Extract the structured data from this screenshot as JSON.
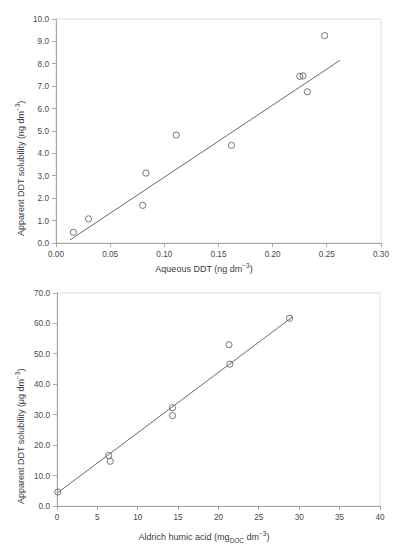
{
  "header": {
    "running_text": ""
  },
  "figure": {
    "panels": [
      {
        "id": "top",
        "y_axis_title_main": "Apparent DDT solubility (ng dm",
        "y_axis_title_sup": "−3",
        "y_axis_title_tail": ")",
        "x_axis_title_main": "Aqueous DDT (ng dm",
        "x_axis_title_sup": "−3",
        "x_axis_title_tail": ")"
      },
      {
        "id": "bottom",
        "y_axis_title_main": "Apparent DDT solubility (μg dm",
        "y_axis_title_sup": "−3",
        "y_axis_title_tail": ")",
        "x_axis_title_pre": "Aldrich humic acid (mg",
        "x_axis_title_sub": "DOC",
        "x_axis_title_mid": " dm",
        "x_axis_title_sup": "−3",
        "x_axis_title_tail": ")"
      }
    ]
  },
  "chart_data": [
    {
      "type": "scatter",
      "id": "apparent-ddt-vs-aqueous-ddt",
      "title": "",
      "xlabel": "Aqueous DDT (ng dm−3)",
      "ylabel": "Apparent DDT solubility (ng dm−3)",
      "xlim": [
        0.0,
        0.3
      ],
      "ylim": [
        0.0,
        10.0
      ],
      "xticks": [
        0.0,
        0.05,
        0.1,
        0.15,
        0.2,
        0.25,
        0.3
      ],
      "xtick_labels": [
        "0.00",
        "0.05",
        "0.10",
        "0.15",
        "0.20",
        "0.25",
        "0.30"
      ],
      "yticks": [
        0.0,
        1.0,
        2.0,
        3.0,
        4.0,
        5.0,
        6.0,
        7.0,
        8.0,
        9.0,
        10.0
      ],
      "ytick_labels": [
        "0.0",
        "1.0",
        "2.0",
        "3.0",
        "4.0",
        "5.0",
        "6.0",
        "7.0",
        "8.0",
        "9.0",
        "10.0"
      ],
      "grid": false,
      "legend": null,
      "marker": "open-circle",
      "points": [
        {
          "x": 0.016,
          "y": 0.48
        },
        {
          "x": 0.03,
          "y": 1.08
        },
        {
          "x": 0.08,
          "y": 1.68
        },
        {
          "x": 0.083,
          "y": 3.12
        },
        {
          "x": 0.111,
          "y": 4.82
        },
        {
          "x": 0.162,
          "y": 4.36
        },
        {
          "x": 0.225,
          "y": 7.44
        },
        {
          "x": 0.228,
          "y": 7.46
        },
        {
          "x": 0.232,
          "y": 6.75
        },
        {
          "x": 0.248,
          "y": 9.26
        }
      ],
      "trendline": {
        "x0": 0.013,
        "y0": 0.14,
        "x1": 0.262,
        "y1": 8.15
      }
    },
    {
      "type": "scatter",
      "id": "apparent-ddt-vs-aldrich-humic-acid",
      "title": "",
      "xlabel": "Aldrich humic acid (mgDOC dm−3)",
      "ylabel": "Apparent DDT solubility (μg dm−3)",
      "xlim": [
        0,
        40
      ],
      "ylim": [
        0.0,
        70.0
      ],
      "xticks": [
        0,
        5,
        10,
        15,
        20,
        25,
        30,
        35,
        40
      ],
      "xtick_labels": [
        "0",
        "5",
        "10",
        "15",
        "20",
        "25",
        "30",
        "35",
        "40"
      ],
      "yticks": [
        0.0,
        10.0,
        20.0,
        30.0,
        40.0,
        50.0,
        60.0,
        70.0
      ],
      "ytick_labels": [
        "0.0",
        "10.0",
        "20.0",
        "30.0",
        "40.0",
        "50.0",
        "60.0",
        "70.0"
      ],
      "grid": false,
      "legend": null,
      "marker": "open-circle",
      "points": [
        {
          "x": 0.1,
          "y": 4.6
        },
        {
          "x": 6.4,
          "y": 16.6
        },
        {
          "x": 6.6,
          "y": 14.7
        },
        {
          "x": 14.3,
          "y": 32.3
        },
        {
          "x": 14.3,
          "y": 29.7
        },
        {
          "x": 21.3,
          "y": 53.0
        },
        {
          "x": 21.4,
          "y": 46.6
        },
        {
          "x": 28.8,
          "y": 61.7
        }
      ],
      "trendline": {
        "x0": 0.0,
        "y0": 4.2,
        "x1": 29.2,
        "y1": 62.2
      }
    }
  ]
}
